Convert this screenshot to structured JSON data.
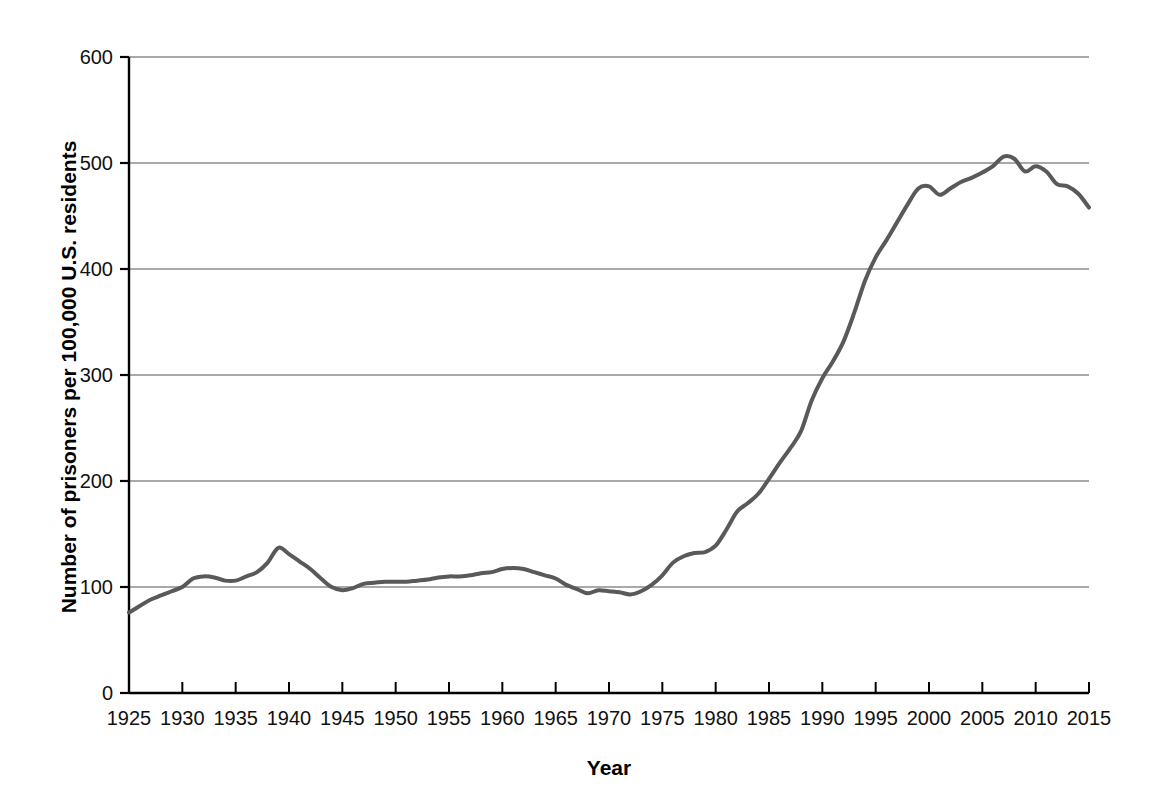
{
  "chart_data": {
    "type": "line",
    "title": "",
    "xlabel": "Year",
    "ylabel": "Number of prisoners per 100,000 U.S. residents",
    "xlim": [
      1925,
      2015
    ],
    "ylim": [
      0,
      600
    ],
    "ytick_step": 100,
    "xtick_step": 5,
    "grid": true,
    "gridlines_y": [
      100,
      200,
      300,
      400,
      500,
      600
    ],
    "legend": "none",
    "line_color": "#595959",
    "line_width": 4,
    "axis_color": "#000000",
    "grid_color": "#8c8c8c",
    "background": "#ffffff",
    "y_ticks": [
      "0",
      "100",
      "200",
      "300",
      "400",
      "500",
      "600"
    ],
    "y_tick_values": [
      0,
      100,
      200,
      300,
      400,
      500,
      600
    ],
    "x_ticks": [
      "1925",
      "1930",
      "1935",
      "1940",
      "1945",
      "1950",
      "1955",
      "1960",
      "1965",
      "1970",
      "1975",
      "1980",
      "1985",
      "1990",
      "1995",
      "2000",
      "2005",
      "2010",
      "2015"
    ],
    "x_tick_values": [
      1925,
      1930,
      1935,
      1940,
      1945,
      1950,
      1955,
      1960,
      1965,
      1970,
      1975,
      1980,
      1985,
      1990,
      1995,
      2000,
      2005,
      2010,
      2015
    ],
    "x": [
      1925,
      1926,
      1927,
      1928,
      1929,
      1930,
      1931,
      1932,
      1933,
      1934,
      1935,
      1936,
      1937,
      1938,
      1939,
      1940,
      1941,
      1942,
      1943,
      1944,
      1945,
      1946,
      1947,
      1948,
      1949,
      1950,
      1951,
      1952,
      1953,
      1954,
      1955,
      1956,
      1957,
      1958,
      1959,
      1960,
      1961,
      1962,
      1963,
      1964,
      1965,
      1966,
      1967,
      1968,
      1969,
      1970,
      1971,
      1972,
      1973,
      1974,
      1975,
      1976,
      1977,
      1978,
      1979,
      1980,
      1981,
      1982,
      1983,
      1984,
      1985,
      1986,
      1987,
      1988,
      1989,
      1990,
      1991,
      1992,
      1993,
      1994,
      1995,
      1996,
      1997,
      1998,
      1999,
      2000,
      2001,
      2002,
      2003,
      2004,
      2005,
      2006,
      2007,
      2008,
      2009,
      2010,
      2011,
      2012,
      2013,
      2014,
      2015
    ],
    "y": [
      76,
      82,
      88,
      92,
      96,
      100,
      108,
      110,
      109,
      106,
      106,
      110,
      114,
      123,
      137,
      131,
      124,
      117,
      108,
      100,
      97,
      99,
      103,
      104,
      105,
      105,
      105,
      106,
      107,
      109,
      110,
      110,
      111,
      113,
      114,
      117,
      118,
      117,
      114,
      111,
      108,
      102,
      98,
      94,
      97,
      96,
      95,
      93,
      96,
      102,
      111,
      123,
      129,
      132,
      133,
      139,
      154,
      171,
      179,
      188,
      202,
      217,
      231,
      247,
      276,
      297,
      313,
      332,
      359,
      389,
      411,
      427,
      444,
      461,
      476,
      478,
      470,
      476,
      482,
      486,
      491,
      497,
      506,
      504,
      492,
      497,
      492,
      480,
      478,
      471,
      458
    ],
    "annotations": []
  }
}
